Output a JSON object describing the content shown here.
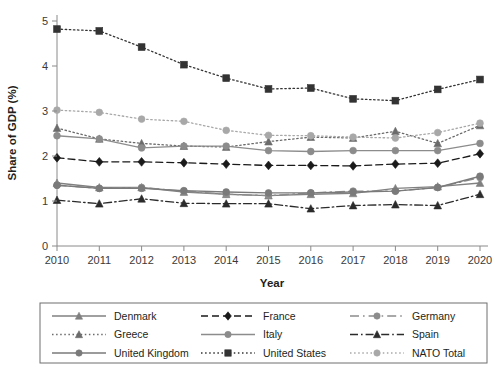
{
  "chart_data": {
    "type": "line",
    "title": "",
    "xlabel": "Year",
    "ylabel": "Share of GDP (%)",
    "x": [
      2010,
      2011,
      2012,
      2013,
      2014,
      2015,
      2016,
      2017,
      2018,
      2019,
      2020
    ],
    "xtick_labels": [
      "2010",
      "2011",
      "2012",
      "2013",
      "2014",
      "2015",
      "2016",
      "2017",
      "2018",
      "2019",
      "2020"
    ],
    "ytick_labels": [
      "0",
      "1",
      "2",
      "3",
      "4",
      "5"
    ],
    "yticks": [
      0,
      1,
      2,
      3,
      4,
      5
    ],
    "ylim": [
      0,
      5.2
    ],
    "xlim": [
      2010,
      2020
    ],
    "grid": false,
    "legend_position": "below",
    "legend_columns": 3,
    "series": [
      {
        "name": "Denmark",
        "marker": "triangle",
        "line_style": "solid",
        "color": "#808080",
        "values": [
          1.4,
          1.3,
          1.3,
          1.2,
          1.15,
          1.12,
          1.15,
          1.17,
          1.28,
          1.32,
          1.4
        ]
      },
      {
        "name": "France",
        "marker": "diamond",
        "line_style": "dashed",
        "color": "#1a1a1a",
        "values": [
          1.96,
          1.87,
          1.87,
          1.85,
          1.82,
          1.79,
          1.79,
          1.78,
          1.82,
          1.84,
          2.05
        ]
      },
      {
        "name": "Germany",
        "marker": "circle",
        "line_style": "dash-dot-long",
        "color": "#8c8c8c",
        "values": [
          1.35,
          1.28,
          1.3,
          1.22,
          1.15,
          1.12,
          1.18,
          1.22,
          1.22,
          1.3,
          1.52
        ]
      },
      {
        "name": "Greece",
        "marker": "triangle",
        "line_style": "dotted",
        "color": "#6b6b6b",
        "values": [
          2.62,
          2.38,
          2.28,
          2.22,
          2.2,
          2.32,
          2.42,
          2.4,
          2.55,
          2.28,
          2.68
        ]
      },
      {
        "name": "Italy",
        "marker": "circle",
        "line_style": "solid",
        "color": "#8c8c8c",
        "values": [
          2.45,
          2.38,
          2.18,
          2.22,
          2.22,
          2.12,
          2.1,
          2.12,
          2.12,
          2.12,
          2.28
        ]
      },
      {
        "name": "Spain",
        "marker": "triangle",
        "line_style": "dash-dot",
        "color": "#2b2b2b",
        "values": [
          1.02,
          0.94,
          1.05,
          0.95,
          0.94,
          0.94,
          0.83,
          0.9,
          0.92,
          0.9,
          1.15
        ]
      },
      {
        "name": "United Kingdom",
        "marker": "circle",
        "line_style": "solid",
        "color": "#7a7a7a",
        "values": [
          1.35,
          1.28,
          1.28,
          1.23,
          1.2,
          1.18,
          1.18,
          1.2,
          1.22,
          1.3,
          1.55
        ]
      },
      {
        "name": "United States",
        "marker": "square",
        "line_style": "dotted",
        "color": "#333333",
        "values": [
          4.82,
          4.78,
          4.42,
          4.03,
          3.73,
          3.49,
          3.51,
          3.27,
          3.23,
          3.48,
          3.7
        ]
      },
      {
        "name": "NATO Total",
        "marker": "circle",
        "line_style": "dotted",
        "color": "#a8a8a8",
        "values": [
          3.02,
          2.97,
          2.82,
          2.77,
          2.57,
          2.46,
          2.45,
          2.42,
          2.4,
          2.52,
          2.73
        ]
      }
    ]
  },
  "legend": {
    "items": [
      {
        "label": "Denmark"
      },
      {
        "label": "France"
      },
      {
        "label": "Germany"
      },
      {
        "label": "Greece"
      },
      {
        "label": "Italy"
      },
      {
        "label": "Spain"
      },
      {
        "label": "United Kingdom"
      },
      {
        "label": "United States"
      },
      {
        "label": "NATO Total"
      }
    ]
  },
  "style": {
    "axis_color": "#8a8a8a",
    "background": "#ffffff",
    "legend_border": "#6e6e6e"
  }
}
